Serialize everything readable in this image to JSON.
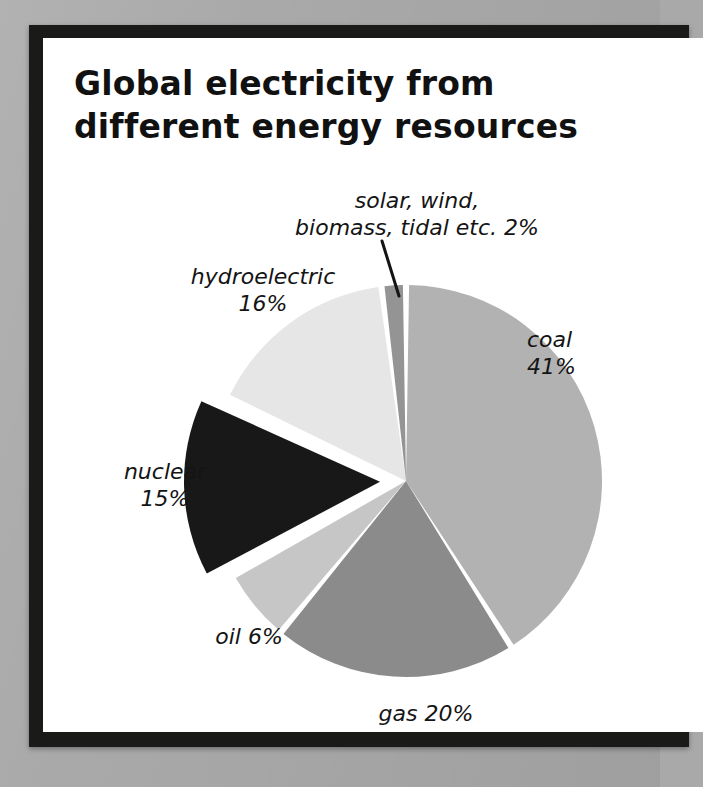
{
  "page": {
    "title_lines": [
      "Global electricity from",
      "different energy resources"
    ],
    "background_color": "#a9a9a9",
    "frame_color": "#1a1a18",
    "sheet_color": "#ffffff",
    "text_color": "#141414"
  },
  "chart_data": {
    "type": "pie",
    "title": "Global electricity from different energy resources",
    "subtitle": "",
    "xlabel": "",
    "ylabel": "",
    "units": "percent",
    "legend_position": "none (direct slice labels)",
    "grid": false,
    "start_angle_deg": 0,
    "direction": "clockwise",
    "total": 100,
    "categories": [
      "coal",
      "gas",
      "oil",
      "nuclear",
      "hydroelectric",
      "solar, wind, biomass, tidal etc."
    ],
    "values": [
      41,
      20,
      6,
      15,
      16,
      2
    ],
    "colors": [
      "#b2b2b2",
      "#8b8b8b",
      "#c6c6c6",
      "#181818",
      "#e6e6e6",
      "#949494"
    ],
    "exploded": [
      "nuclear"
    ],
    "slices": [
      {
        "key": "coal",
        "name": "coal",
        "value": 41,
        "label": "coal\n41%",
        "percent_text": "41%",
        "color": "#b2b2b2",
        "exploded": false,
        "has_leader_line": false
      },
      {
        "key": "gas",
        "name": "gas",
        "value": 20,
        "label": "gas 20%",
        "percent_text": "20%",
        "color": "#8b8b8b",
        "exploded": false,
        "has_leader_line": false
      },
      {
        "key": "oil",
        "name": "oil",
        "value": 6,
        "label": "oil 6%",
        "percent_text": "6%",
        "color": "#c6c6c6",
        "exploded": false,
        "has_leader_line": false
      },
      {
        "key": "nuclear",
        "name": "nuclear",
        "value": 15,
        "label": "nuclear\n15%",
        "percent_text": "15%",
        "color": "#181818",
        "exploded": true,
        "has_leader_line": false
      },
      {
        "key": "hydroelectric",
        "name": "hydroelectric",
        "value": 16,
        "label": "hydroelectric\n16%",
        "percent_text": "16%",
        "color": "#e6e6e6",
        "exploded": false,
        "has_leader_line": false
      },
      {
        "key": "renewables",
        "name": "solar, wind, biomass, tidal etc.",
        "value": 2,
        "label": "solar, wind,\nbiomass, tidal etc. 2%",
        "percent_text": "2%",
        "color": "#949494",
        "exploded": false,
        "has_leader_line": true
      }
    ]
  }
}
